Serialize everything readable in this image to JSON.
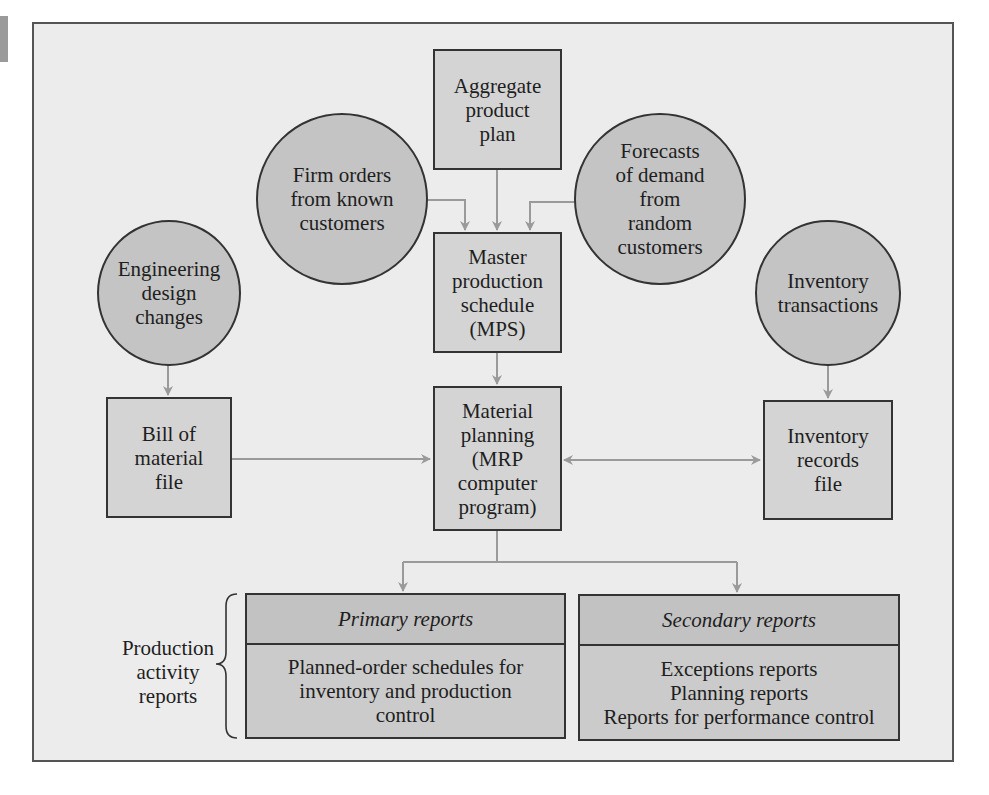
{
  "diagram": {
    "nodes": {
      "aggregate_plan": {
        "label": "Aggregate\nproduct\nplan",
        "shape": "rectangle"
      },
      "firm_orders": {
        "label": "Firm orders\nfrom known\ncustomers",
        "shape": "circle"
      },
      "forecasts": {
        "label": "Forecasts\nof demand\nfrom\nrandom\ncustomers",
        "shape": "circle"
      },
      "mps": {
        "label": "Master\nproduction\nschedule\n(MPS)",
        "shape": "rectangle"
      },
      "engineering_changes": {
        "label": "Engineering\ndesign\nchanges",
        "shape": "circle"
      },
      "inventory_transactions": {
        "label": "Inventory\ntransactions",
        "shape": "circle"
      },
      "bill_of_material": {
        "label": "Bill of\nmaterial\nfile",
        "shape": "rectangle"
      },
      "material_planning": {
        "label": "Material\nplanning\n(MRP\ncomputer\nprogram)",
        "shape": "rectangle"
      },
      "inventory_records": {
        "label": "Inventory\nrecords\nfile",
        "shape": "rectangle"
      }
    },
    "reports": {
      "group_label": "Production\nactivity\nreports",
      "primary": {
        "title": "Primary reports",
        "body": "Planned-order schedules for\ninventory and production\ncontrol"
      },
      "secondary": {
        "title": "Secondary reports",
        "body": "Exceptions reports\nPlanning reports\nReports for performance control"
      }
    },
    "edges": [
      {
        "from": "aggregate_plan",
        "to": "mps"
      },
      {
        "from": "firm_orders",
        "to": "mps"
      },
      {
        "from": "forecasts",
        "to": "mps"
      },
      {
        "from": "mps",
        "to": "material_planning"
      },
      {
        "from": "engineering_changes",
        "to": "bill_of_material"
      },
      {
        "from": "bill_of_material",
        "to": "material_planning"
      },
      {
        "from": "inventory_transactions",
        "to": "inventory_records"
      },
      {
        "from": "material_planning",
        "to": "inventory_records",
        "bidirectional": true
      },
      {
        "from": "material_planning",
        "to": "primary_reports"
      },
      {
        "from": "material_planning",
        "to": "secondary_reports"
      }
    ],
    "colors": {
      "background": "#ececec",
      "box_fill": "#d4d4d4",
      "circle_fill": "#c4c4c4",
      "report_fill": "#c7c7c7",
      "arrow": "#9a9a9a",
      "border": "#333333"
    }
  }
}
